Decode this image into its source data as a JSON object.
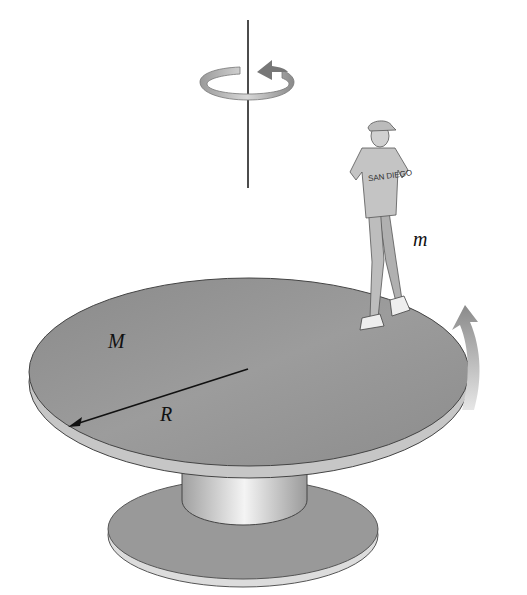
{
  "figure": {
    "labels": {
      "disk_mass": "M",
      "radius": "R",
      "person_mass": "m",
      "shirt_text": "SAN DIEGO"
    },
    "colors": {
      "disk_top": "#8f8f8f",
      "disk_edge": "#bdbdbd",
      "base": "#9a9a9a",
      "arrow": "#a8a8a8",
      "line": "#111111"
    }
  }
}
